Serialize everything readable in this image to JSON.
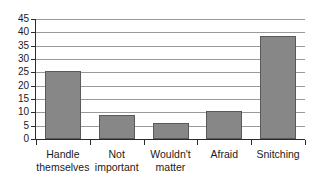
{
  "chart_data": {
    "type": "bar",
    "title": "",
    "subtitle": "",
    "xlabel": "",
    "ylabel": "",
    "categories": [
      "Handle themselves",
      "Not important",
      "Wouldn't matter",
      "Afraid",
      "Snitching"
    ],
    "category_lines": [
      [
        "Handle",
        "themselves"
      ],
      [
        "Not",
        "important"
      ],
      [
        "Wouldn't",
        "matter"
      ],
      [
        "Afraid",
        ""
      ],
      [
        "Snitching",
        ""
      ]
    ],
    "values": [
      25.5,
      9,
      6,
      10.5,
      38.5
    ],
    "ylim": [
      0,
      45
    ],
    "ytick_values": [
      0,
      5,
      10,
      15,
      20,
      25,
      30,
      35,
      40,
      45
    ],
    "ytick_labels": [
      "0",
      "5",
      "10",
      "15",
      "20",
      "25",
      "30",
      "35",
      "40",
      "45"
    ],
    "grid": true,
    "legend": false,
    "legend_position": "none",
    "bar_color": "#878787",
    "bar_border_color": "#5a5a5a",
    "gridline_color": "#9a9a9a",
    "axis_color": "#2b2b2b",
    "background_color": "#ffffff"
  }
}
